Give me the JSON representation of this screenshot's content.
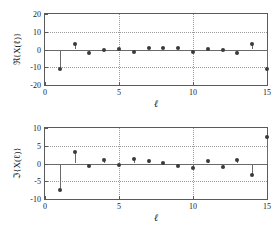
{
  "chart_data": [
    {
      "type": "scatter",
      "title": "",
      "subtitle": "",
      "plot_style": "stem",
      "xlabel": "ℓ",
      "ylabel": "ℜ{X(ℓ)}",
      "xlim": [
        0,
        15
      ],
      "ylim": [
        -20,
        20
      ],
      "xticks": [
        0,
        5,
        10,
        15
      ],
      "xtick_labels": [
        "0",
        "5",
        "10",
        "15"
      ],
      "yticks": [
        -20,
        -10,
        0,
        10,
        20
      ],
      "ytick_labels": [
        "-20",
        "-10",
        "0",
        "10",
        "20"
      ],
      "grid": true,
      "legend": "none",
      "baseline": 0,
      "x": [
        1,
        2,
        3,
        4,
        5,
        6,
        7,
        8,
        9,
        10,
        11,
        12,
        13,
        14,
        15
      ],
      "values": [
        -11.2,
        3.1,
        -2.1,
        -0.2,
        0.4,
        -1.2,
        0.8,
        0.9,
        0.7,
        -1.3,
        0.4,
        -0.2,
        -2.2,
        3.0,
        -11.0
      ]
    },
    {
      "type": "scatter",
      "title": "",
      "subtitle": "",
      "plot_style": "stem",
      "xlabel": "ℓ",
      "ylabel": "ℑ{X(ℓ)}",
      "xlim": [
        0,
        15
      ],
      "ylim": [
        -10,
        10
      ],
      "xticks": [
        0,
        5,
        10,
        15
      ],
      "xtick_labels": [
        "0",
        "5",
        "10",
        "15"
      ],
      "yticks": [
        -10,
        -5,
        0,
        5,
        10
      ],
      "ytick_labels": [
        "-10",
        "-5",
        "0",
        "5",
        "10"
      ],
      "grid": true,
      "legend": "none",
      "baseline": 0,
      "x": [
        1,
        2,
        3,
        4,
        5,
        6,
        7,
        8,
        9,
        10,
        11,
        12,
        13,
        14,
        15
      ],
      "values": [
        -7.6,
        3.2,
        -0.8,
        1.1,
        -0.5,
        1.3,
        0.6,
        0.1,
        -0.6,
        -1.2,
        0.7,
        -1.0,
        0.9,
        -3.2,
        7.5
      ]
    }
  ],
  "style": {
    "marker_color": "#3a3a3a",
    "stem_color": "#6a6a6a",
    "axis_color": "#5a5a5a",
    "grid_color": "#9a9a9a",
    "background": "#ffffff",
    "text_color": "#1a1a1a"
  }
}
